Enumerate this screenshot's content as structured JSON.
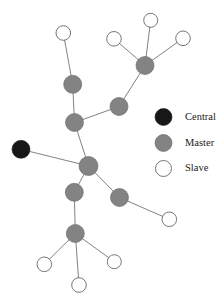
{
  "figure": {
    "width": 224,
    "height": 302,
    "background": "#ffffff"
  },
  "colors": {
    "central": "#171717",
    "master": "#838383",
    "slave": "#ffffff",
    "slave_stroke": "#5e5e5e",
    "edge": "#6b6b6b",
    "text": "#1a1a1a"
  },
  "chart_data": {
    "type": "scatter",
    "title": "",
    "xlabel": "",
    "ylabel": "",
    "grid": false,
    "legend_position": "right",
    "nodes": [
      {
        "id": "n1",
        "type": "slave",
        "x": 63.3,
        "y": 33.0,
        "r": 7.3
      },
      {
        "id": "n2",
        "type": "master",
        "x": 72.7,
        "y": 84.3,
        "r": 9.0
      },
      {
        "id": "n3",
        "type": "master",
        "x": 74.5,
        "y": 122.5,
        "r": 9.0
      },
      {
        "id": "n4",
        "type": "master",
        "x": 119.0,
        "y": 106.5,
        "r": 9.0
      },
      {
        "id": "n5",
        "type": "master",
        "x": 145.0,
        "y": 65.5,
        "r": 9.0
      },
      {
        "id": "n6",
        "type": "slave",
        "x": 150.7,
        "y": 20.3,
        "r": 7.0
      },
      {
        "id": "n7",
        "type": "slave",
        "x": 114.0,
        "y": 38.8,
        "r": 7.3
      },
      {
        "id": "n8",
        "type": "slave",
        "x": 183.0,
        "y": 38.3,
        "r": 7.3
      },
      {
        "id": "n9",
        "type": "central",
        "x": 21.0,
        "y": 149.3,
        "r": 9.0
      },
      {
        "id": "n10",
        "type": "master",
        "x": 88.5,
        "y": 166.0,
        "r": 9.5
      },
      {
        "id": "n11",
        "type": "master",
        "x": 74.3,
        "y": 192.3,
        "r": 9.0
      },
      {
        "id": "n12",
        "type": "master",
        "x": 119.5,
        "y": 197.5,
        "r": 9.0
      },
      {
        "id": "n13",
        "type": "slave",
        "x": 169.3,
        "y": 219.3,
        "r": 7.3
      },
      {
        "id": "n14",
        "type": "master",
        "x": 75.3,
        "y": 233.5,
        "r": 9.0
      },
      {
        "id": "n15",
        "type": "slave",
        "x": 44.3,
        "y": 264.3,
        "r": 7.3
      },
      {
        "id": "n16",
        "type": "slave",
        "x": 79.0,
        "y": 285.0,
        "r": 7.3
      },
      {
        "id": "n17",
        "type": "slave",
        "x": 114.3,
        "y": 261.7,
        "r": 7.0
      }
    ],
    "edges": [
      {
        "from": "n1",
        "to": "n2"
      },
      {
        "from": "n2",
        "to": "n3"
      },
      {
        "from": "n3",
        "to": "n4"
      },
      {
        "from": "n4",
        "to": "n5"
      },
      {
        "from": "n5",
        "to": "n6"
      },
      {
        "from": "n5",
        "to": "n7"
      },
      {
        "from": "n5",
        "to": "n8"
      },
      {
        "from": "n3",
        "to": "n10"
      },
      {
        "from": "n9",
        "to": "n10"
      },
      {
        "from": "n10",
        "to": "n11"
      },
      {
        "from": "n10",
        "to": "n12"
      },
      {
        "from": "n12",
        "to": "n13"
      },
      {
        "from": "n11",
        "to": "n14"
      },
      {
        "from": "n14",
        "to": "n15"
      },
      {
        "from": "n14",
        "to": "n16"
      },
      {
        "from": "n14",
        "to": "n17"
      }
    ]
  },
  "legend": {
    "items": [
      {
        "key": "central",
        "label": "Central",
        "marker_x": 163.5,
        "marker_y": 117.0,
        "marker_r": 8.5,
        "label_x": 185.0
      },
      {
        "key": "master",
        "label": "Master",
        "marker_x": 163.5,
        "marker_y": 143.0,
        "marker_r": 8.5,
        "label_x": 185.0
      },
      {
        "key": "slave",
        "label": "Slave",
        "marker_x": 163.5,
        "marker_y": 168.5,
        "marker_r": 8.0,
        "label_x": 185.0
      }
    ]
  }
}
